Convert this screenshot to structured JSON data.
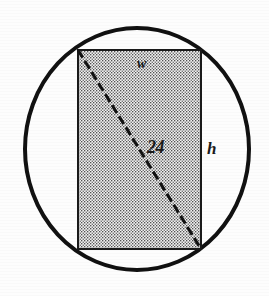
{
  "figure": {
    "background_color": "#fdfdfd",
    "width": 269,
    "height": 296
  },
  "circle": {
    "name": "circumscribed-circle",
    "center_x": 137,
    "center_y": 149,
    "radius_x": 112,
    "radius_y": 121,
    "stroke_color": "#111111",
    "stroke_width": 4,
    "fill": "none"
  },
  "rectangle": {
    "name": "inscribed-rectangle",
    "left": 78,
    "top": 50,
    "right": 201,
    "bottom": 249,
    "width_px": 123,
    "height_px": 199,
    "stroke_color": "#1a1a1a",
    "stroke_width": 2,
    "fill_pattern": "stipple-dots",
    "fill_color": "#d9d9d9",
    "dot_color": "#4a4a4a"
  },
  "diagonal": {
    "name": "diagonal-line",
    "x1": 78,
    "y1": 50,
    "x2": 201,
    "y2": 249,
    "style": "dashed",
    "stroke_color": "#121212",
    "stroke_width": 3,
    "dash_pattern": "9 4"
  },
  "labels": {
    "width_label": {
      "text": "w",
      "x": 143,
      "y": 65,
      "meaning": "rectangle width"
    },
    "height_label": {
      "text": "h",
      "x": 212,
      "y": 150,
      "meaning": "rectangle height"
    },
    "diagonal_label": {
      "text": "24",
      "x": 157,
      "y": 148,
      "meaning": "diagonal length"
    }
  }
}
